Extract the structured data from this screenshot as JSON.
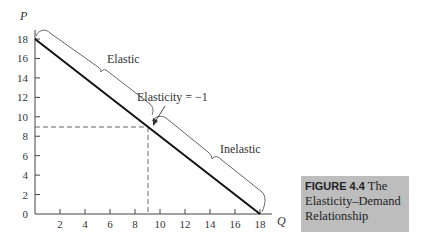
{
  "chart_data": {
    "type": "line",
    "title": "The Elasticity–Demand Relationship",
    "figure_label": "FIGURE 4.4",
    "xlabel": "Q",
    "ylabel": "P",
    "xlim": [
      0,
      18
    ],
    "ylim": [
      0,
      18
    ],
    "x_ticks": [
      2,
      4,
      6,
      8,
      10,
      12,
      14,
      16,
      18
    ],
    "y_ticks": [
      0,
      2,
      4,
      6,
      8,
      10,
      12,
      14,
      16,
      18
    ],
    "grid": false,
    "series": [
      {
        "name": "Demand",
        "x": [
          0,
          18
        ],
        "y": [
          18,
          0
        ]
      }
    ],
    "reference_point": {
      "x": 9,
      "y": 9,
      "dashed_guides": true
    },
    "annotations": [
      {
        "text": "Elastic",
        "region": "Q 0–9 (upper segment)"
      },
      {
        "text": "Elasticity = −1",
        "at": [
          9,
          9
        ]
      },
      {
        "text": "Inelastic",
        "region": "Q 9–18 (lower segment)"
      }
    ]
  },
  "axes": {
    "y_label": "P",
    "x_label": "Q",
    "y_ticks": [
      "0",
      "2",
      "4",
      "6",
      "8",
      "10",
      "12",
      "14",
      "16",
      "18"
    ],
    "x_ticks": [
      "2",
      "4",
      "6",
      "8",
      "10",
      "12",
      "14",
      "16",
      "18"
    ]
  },
  "annotations": {
    "elastic": "Elastic",
    "unit": "Elasticity = −1",
    "inelastic": "Inelastic"
  },
  "caption": {
    "number": "FIGURE 4.4",
    "title": " The Elasticity–Demand Relationship"
  }
}
